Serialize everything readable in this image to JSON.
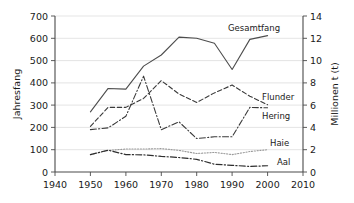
{
  "chart_data": {
    "type": "line",
    "title": "",
    "xlabel": "",
    "ylabel": "Jahresfang",
    "ylabel_right": "Millionen t (t)",
    "xlim": [
      1940,
      2010
    ],
    "ylim": [
      0,
      700
    ],
    "ylim_right": [
      0,
      14
    ],
    "grid": true,
    "legend_position": "inline-right-of-series",
    "x_ticks": [
      1940,
      1950,
      1960,
      1970,
      1980,
      1990,
      2000,
      2010
    ],
    "y_ticks_left": [
      0,
      100,
      200,
      300,
      400,
      500,
      600,
      700
    ],
    "y_ticks_right": [
      0,
      2,
      4,
      6,
      8,
      10,
      12,
      14
    ],
    "x": [
      1950,
      1955,
      1960,
      1965,
      1970,
      1975,
      1980,
      1985,
      1990,
      1995,
      2000
    ],
    "series": [
      {
        "name": "Gesamtfang",
        "style": "solid",
        "color": "#4d4d4d",
        "values": [
          270,
          375,
          372,
          475,
          525,
          605,
          600,
          578,
          460,
          595,
          612
        ]
      },
      {
        "name": "Flunder",
        "style": "dashed",
        "color": "#3a3a3a",
        "values": [
          205,
          290,
          290,
          330,
          410,
          350,
          312,
          355,
          390,
          340,
          302
        ]
      },
      {
        "name": "Hering",
        "style": "dash-dot",
        "color": "#3a3a3a",
        "values": [
          190,
          198,
          250,
          430,
          190,
          225,
          150,
          158,
          158,
          290,
          288
        ]
      },
      {
        "name": "Haie",
        "style": "dotted",
        "color": "#9a9a9a",
        "values": [
          78,
          97,
          103,
          103,
          105,
          97,
          83,
          88,
          78,
          92,
          100
        ]
      },
      {
        "name": "Aal",
        "style": "dash-dot",
        "color": "#2e2e2e",
        "values": [
          78,
          98,
          78,
          77,
          70,
          65,
          57,
          35,
          30,
          25,
          28
        ]
      }
    ]
  },
  "axes": {
    "left_title": "Jahresfang",
    "right_title": "Millionen t (t)",
    "x_tick_labels": [
      "1940",
      "1950",
      "1960",
      "1970",
      "1980",
      "1990",
      "2000",
      "2010"
    ],
    "y_left_tick_labels": [
      "0",
      "100",
      "200",
      "300",
      "400",
      "500",
      "600",
      "700"
    ],
    "y_right_tick_labels": [
      "0",
      "2",
      "4",
      "6",
      "8",
      "10",
      "12",
      "14"
    ]
  },
  "series_labels": {
    "gesamtfang": "Gesamtfang",
    "flunder": "Flunder",
    "hering": "Hering",
    "haie": "Haie",
    "aal": "Aal"
  }
}
